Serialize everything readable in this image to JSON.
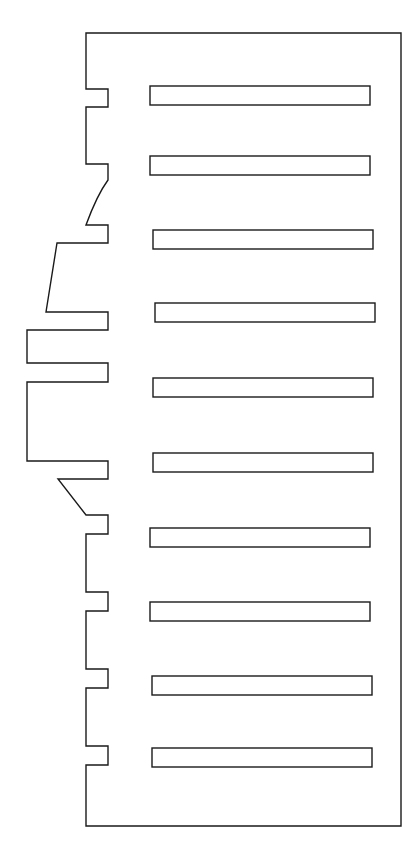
{
  "document": {
    "type": "technical-line-drawing",
    "subject": "slotted-comb-plate-outline",
    "background_color": "#ffffff",
    "stroke_color": "#1a1a1a",
    "fill_color": "#ffffff",
    "stroke_width": 1.4,
    "canvas": {
      "width": 420,
      "height": 849
    }
  },
  "geometry": {
    "outline_description": "Closed polygon with a straight right edge, straight top and bottom edges, and a stepped/notched left profile containing rectangular notches, one convex arc and two straight diagonal transitions.",
    "bounds": {
      "left": 26,
      "top": 33,
      "right": 401,
      "bottom": 826
    },
    "outline_path": "M 86 33 L 401 33 L 401 826 L 86 826 L 86 765 L 108 765 L 108 746 L 86 746 L 86 688 L 108 688 L 108 669 L 86 669 L 86 611 L 108 611 L 108 592 L 86 592 L 86 534 L 108 534 L 108 515 L 86 515 L 58 479 L 108 479 L 108 461 L 27 461 L 27 382 L 108 382 L 108 363 L 27 363 L 27 330 L 108 330 L 108 312 L 46 312 L 57 243 L 108 243 L 108 225 L 86 225 Q 97 195 108 180 L 108 164 L 86 164 L 86 107 L 108 107 L 108 89 L 86 89 Z",
    "slots": {
      "count": 10,
      "width": 220,
      "height": 19,
      "left_x": [
        150,
        150,
        153,
        155,
        153,
        153,
        150,
        150,
        152,
        152
      ],
      "top_y": [
        86,
        156,
        230,
        303,
        378,
        453,
        528,
        602,
        676,
        748
      ],
      "corner_style": "square"
    }
  },
  "labels": {
    "title": "",
    "annotations": [],
    "dimensions": []
  }
}
